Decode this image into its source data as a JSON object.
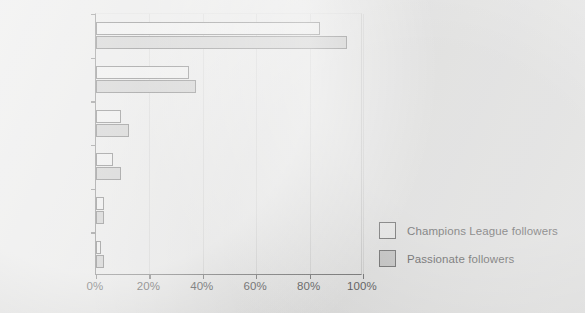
{
  "chart_data": {
    "type": "bar",
    "orientation": "horizontal",
    "title": "",
    "xlabel": "",
    "ylabel": "",
    "xlim": [
      0,
      100
    ],
    "xunit": "%",
    "grid": true,
    "legend_position": "bottom-right",
    "categories": [
      "TV",
      "Newspapers",
      "Radio",
      "Internet",
      "Spectating",
      "Magazines"
    ],
    "xticklabels": [
      "0%",
      "20%",
      "40%",
      "60%",
      "80%",
      "100%"
    ],
    "xtickvalues": [
      0,
      20,
      40,
      60,
      80,
      100
    ],
    "series": [
      {
        "name": "Champions League followers",
        "color": "#e3e3e2",
        "values": [
          84,
          35,
          9.5,
          6.5,
          3,
          2
        ]
      },
      {
        "name": "Passionate followers",
        "color": "#b3b3b2",
        "values": [
          94,
          37.5,
          12.5,
          9.5,
          3,
          3
        ]
      }
    ]
  },
  "legend": {
    "entries": [
      {
        "label": "Champions League followers"
      },
      {
        "label": "Passionate followers"
      }
    ]
  }
}
